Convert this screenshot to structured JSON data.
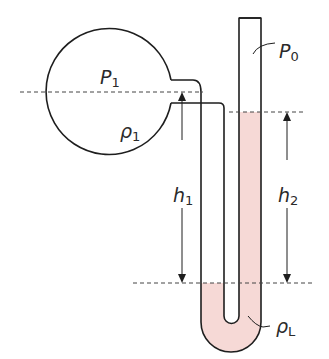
{
  "diagram": {
    "title": "",
    "type": "manometer",
    "labels": {
      "P1": {
        "main": "P",
        "sub": "1"
      },
      "rho1": {
        "main": "ρ",
        "sub": "1"
      },
      "P0": {
        "main": "P",
        "sub": "0"
      },
      "h1": {
        "main": "h",
        "sub": "1"
      },
      "h2": {
        "main": "h",
        "sub": "2"
      },
      "rhoL": {
        "main": "ρ",
        "sub": "L"
      }
    },
    "colors": {
      "stroke": "#1e1e1e",
      "liquid": "#f6d9d6",
      "dash": "#444444"
    }
  }
}
